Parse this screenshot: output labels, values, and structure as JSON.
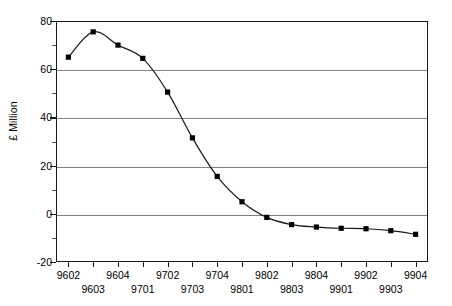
{
  "chart_data": {
    "type": "line",
    "title": "",
    "xlabel": "",
    "ylabel": "£ Million",
    "ylim": [
      -20,
      80
    ],
    "y_ticks": [
      80,
      60,
      40,
      20,
      0,
      -20
    ],
    "y_tick_labels": [
      "80",
      "60",
      "40",
      "20",
      "0",
      "-20"
    ],
    "y_minor_ticks": [
      70,
      50,
      30,
      10,
      -10
    ],
    "grid": true,
    "legend": "none",
    "marker": "filled-square",
    "line_color": "#1a1a1a",
    "marker_color": "#000000",
    "grid_color": "#808080",
    "axis_color": "#1a1a1a",
    "categories": [
      "9602",
      "9603",
      "9604",
      "9701",
      "9702",
      "9703",
      "9704",
      "9801",
      "9802",
      "9803",
      "9804",
      "9901",
      "9902",
      "9903",
      "9904"
    ],
    "values": [
      65,
      75.5,
      70,
      64.5,
      50.5,
      31.5,
      15.5,
      5,
      -1.5,
      -4.5,
      -5.5,
      -6,
      -6.2,
      -7,
      -8.5
    ]
  },
  "axes": {
    "y_title": "£ Million"
  }
}
